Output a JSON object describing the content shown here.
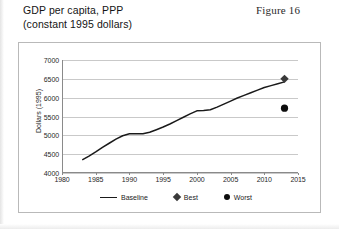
{
  "caption": {
    "title": "GDP per capita, PPP\n(constant 1995 dollars)",
    "figure_label": "Figure 16"
  },
  "legend": {
    "baseline_label": "Baseline",
    "best_label": "Best",
    "worst_label": "Worst"
  },
  "colors": {
    "baseline_line": "#1a1a1a",
    "best_marker": "#3a3a3a",
    "worst_marker": "#0d0d0d",
    "gridline": "#c9c9c9",
    "axis": "#8a8a8a",
    "frame_border": "#b9b9b9"
  },
  "chart_data": {
    "type": "line",
    "title": "GDP per capita, PPP (constant 1995 dollars)",
    "xlabel": "",
    "ylabel": "Dollars (1995)",
    "xlim": [
      1980,
      2015
    ],
    "ylim": [
      4000,
      7000
    ],
    "grid": true,
    "legend_position": "bottom",
    "ytick_labels": [
      "4000",
      "4500",
      "5000",
      "5500",
      "6000",
      "6500",
      "7000"
    ],
    "ytick_values": [
      4000,
      4500,
      5000,
      5500,
      6000,
      6500,
      7000
    ],
    "xtick_labels": [
      "1980",
      "1985",
      "1990",
      "1995",
      "2000",
      "2005",
      "2010",
      "2015"
    ],
    "xtick_values": [
      1980,
      1985,
      1990,
      1995,
      2000,
      2005,
      2010,
      2015
    ],
    "series": [
      {
        "name": "Baseline",
        "type": "line",
        "x": [
          1983,
          1984,
          1985,
          1986,
          1987,
          1988,
          1989,
          1990,
          1991,
          1992,
          1993,
          1994,
          1995,
          1996,
          1997,
          1998,
          1999,
          2000,
          2001,
          2002,
          2003,
          2004,
          2005,
          2006,
          2007,
          2008,
          2009,
          2010,
          2011,
          2012,
          2013
        ],
        "values": [
          4350,
          4450,
          4560,
          4680,
          4790,
          4900,
          4990,
          5040,
          5040,
          5040,
          5080,
          5150,
          5220,
          5300,
          5390,
          5480,
          5570,
          5650,
          5660,
          5680,
          5750,
          5830,
          5910,
          5990,
          6060,
          6130,
          6200,
          6270,
          6320,
          6370,
          6420
        ]
      },
      {
        "name": "Best",
        "type": "scatter",
        "marker": "diamond",
        "x": [
          2013
        ],
        "values": [
          6500
        ]
      },
      {
        "name": "Worst",
        "type": "scatter",
        "marker": "circle",
        "x": [
          2013
        ],
        "values": [
          5720
        ]
      }
    ]
  }
}
